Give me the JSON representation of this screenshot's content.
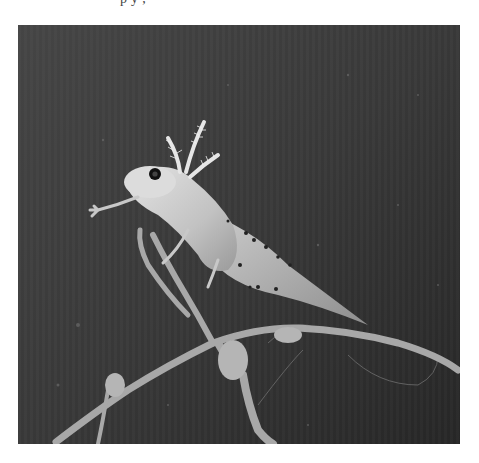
{
  "page": {
    "cropped_caption_fragment": "p   y   ,",
    "background_color": "#ffffff"
  },
  "photo": {
    "description": "Black-and-white photograph of a larval salamander with feathery external gills perched on a thin twig against a dark background",
    "subject": "larval salamander",
    "tone": "grayscale",
    "frame": {
      "x": 18,
      "y": 25,
      "width": 442,
      "height": 419
    },
    "colors": {
      "background_dark": "#2e2e2e",
      "background_mid": "#3d3d3d",
      "body_light": "#d6d6d6",
      "body_mid": "#b4b4b4",
      "spots": "#222222",
      "twig": "#a9a9a9"
    }
  }
}
